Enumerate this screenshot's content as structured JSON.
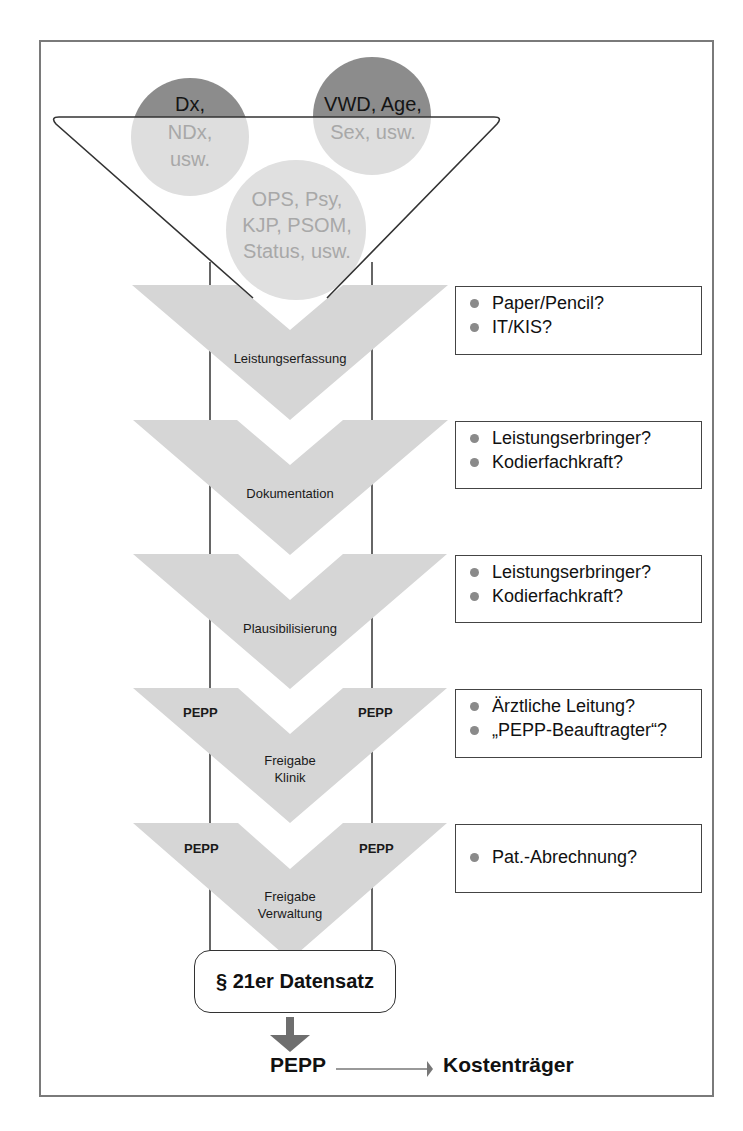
{
  "diagram": {
    "title": "",
    "inputs": {
      "circle_left": {
        "top": "Dx,",
        "bottom_lines": [
          "NDx,",
          "usw."
        ]
      },
      "circle_right": {
        "top": "VWD, Age,",
        "bottom_lines": [
          "Sex, usw."
        ]
      },
      "circle_center": {
        "lines": [
          "OPS, Psy,",
          "KJP, PSOM,",
          "Status, usw."
        ]
      }
    },
    "steps": [
      {
        "label": "Leistungserfassung",
        "pepp_tags": false,
        "questions": [
          "Paper/Pencil?",
          "IT/KIS?"
        ]
      },
      {
        "label": "Dokumentation",
        "pepp_tags": false,
        "questions": [
          "Leistungserbringer?",
          "Kodierfachkraft?"
        ]
      },
      {
        "label": "Plausibilisierung",
        "pepp_tags": false,
        "questions": [
          "Leistungserbringer?",
          "Kodierfachkraft?"
        ]
      },
      {
        "label_lines": [
          "Freigabe",
          "Klinik"
        ],
        "pepp_tags": true,
        "pepp_left": "PEPP",
        "pepp_right": "PEPP",
        "questions": [
          "Ärztliche Leitung?",
          "„PEPP-Beauftragter“?"
        ]
      },
      {
        "label_lines": [
          "Freigabe",
          "Verwaltung"
        ],
        "pepp_tags": true,
        "pepp_left": "PEPP",
        "pepp_right": "PEPP",
        "questions": [
          "Pat.-Abrechnung?"
        ]
      }
    ],
    "output_box": "§ 21er Datensatz",
    "final": {
      "source": "PEPP",
      "target": "Kostenträger"
    },
    "colors": {
      "chevron_fill": "#d6d6d6",
      "circle_dark": "#8c8c8c",
      "circle_light": "#dedede",
      "line": "#333333",
      "frame": "#7a7a7a",
      "bullet": "#8a8a8a",
      "arrow": "#6e6e6e"
    }
  }
}
